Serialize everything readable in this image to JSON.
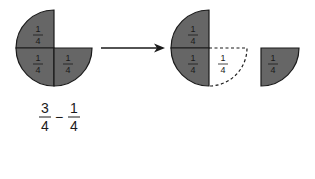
{
  "colors": {
    "fill": "#666666",
    "stroke": "#1a1a1a",
    "background": "#ffffff"
  },
  "before": {
    "pieces": [
      {
        "quadrant": "top-left",
        "label_num": "1",
        "label_den": "4"
      },
      {
        "quadrant": "bottom-left",
        "label_num": "1",
        "label_den": "4"
      },
      {
        "quadrant": "bottom-right",
        "label_num": "1",
        "label_den": "4"
      }
    ]
  },
  "arrow": {
    "direction": "right"
  },
  "after": {
    "pieces": [
      {
        "quadrant": "top-left",
        "label_num": "1",
        "label_den": "4",
        "style": "filled"
      },
      {
        "quadrant": "bottom-left",
        "label_num": "1",
        "label_den": "4",
        "style": "filled"
      },
      {
        "quadrant": "bottom-right",
        "label_num": "1",
        "label_den": "4",
        "style": "dashed-outline"
      }
    ],
    "removed_piece": {
      "label_num": "1",
      "label_den": "4"
    }
  },
  "expression": {
    "left_num": "3",
    "left_den": "4",
    "operator": "−",
    "right_num": "1",
    "right_den": "4"
  }
}
